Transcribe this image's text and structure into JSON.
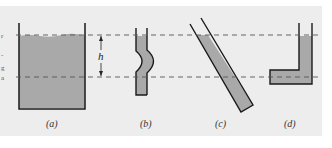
{
  "figure": {
    "dimension_label": "h",
    "panels": [
      {
        "id": "a",
        "label": "(a)",
        "shape": "open-tank"
      },
      {
        "id": "b",
        "label": "(b)",
        "shape": "tube-with-bulge"
      },
      {
        "id": "c",
        "label": "(c)",
        "shape": "inclined-tube"
      },
      {
        "id": "d",
        "label": "(d)",
        "shape": "l-shaped-tube"
      }
    ],
    "colors": {
      "liquid": "#a9a9a9",
      "outline": "#1a1a1a",
      "background": "#ededed",
      "dashed_line": "#555555"
    },
    "left_edge_fragments": [
      "r",
      "-",
      "g",
      "a"
    ]
  }
}
